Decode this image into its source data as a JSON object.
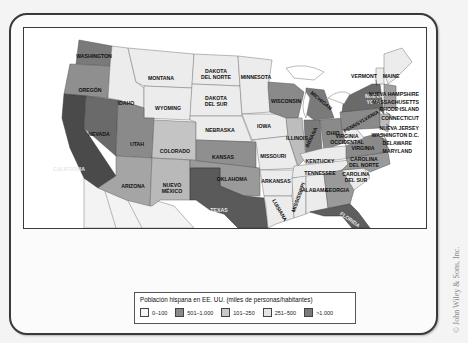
{
  "map": {
    "title": "Población hispana en EE. UU. (miles de personas/habitantes)",
    "colors": {
      "c0_100": "#ececec",
      "c101_250": "#c9c9c9",
      "c251_500": "#a9a9a9",
      "c501_1000": "#8a8a8a",
      "c1000_plus": "#555555",
      "water": "#ffffff",
      "mexico": "#f2f2f2"
    },
    "states": {
      "washington": "WASHINGTON",
      "oregon": "OREGÓN",
      "california": "CALIFORNIA",
      "nevada": "NEVADA",
      "idaho": "IDAHO",
      "montana": "MONTANA",
      "wyoming": "WYOMING",
      "utah": "UTAH",
      "colorado": "COLORADO",
      "arizona": "ARIZONA",
      "nuevo_mexico_1": "NUEVO",
      "nuevo_mexico_2": "MÉXICO",
      "dakota_norte_1": "DAKOTA",
      "dakota_norte_2": "DEL NORTE",
      "dakota_sur_1": "DAKOTA",
      "dakota_sur_2": "DEL SUR",
      "nebraska": "NEBRASKA",
      "kansas": "KANSAS",
      "oklahoma": "OKLAHOMA",
      "texas": "TEXAS",
      "minnesota": "MINNESOTA",
      "iowa": "IOWA",
      "missouri": "MISSOURI",
      "arkansas": "ARKANSAS",
      "luisiana": "LUISIANA",
      "wisconsin": "WISCONSIN",
      "illinois": "ILLINOIS",
      "michigan": "MICHIGAN",
      "indiana": "INDIANA",
      "ohio": "OHIO",
      "kentucky": "KENTUCKY",
      "tennessee": "TENNESSEE",
      "mississippi": "MISSISSIPPI",
      "alabama": "ALABAMA",
      "georgia": "GEORGIA",
      "florida": "FLORIDA",
      "carolina_sur_1": "CAROLINA",
      "carolina_sur_2": "DEL SUR",
      "carolina_norte_1": "CAROLINA",
      "carolina_norte_2": "DEL NORTE",
      "virginia": "VIRGINIA",
      "virginia_occ_1": "VIRGINIA",
      "virginia_occ_2": "OCCIDENTAL",
      "pennsylvania": "PENNSYLVANIA",
      "nueva_york_1": "NUEVA",
      "nueva_york_2": "YORK",
      "vermont": "VERMONT",
      "maine": "MAINE",
      "nueva_hampshire": "NUEVA HAMPSHIRE",
      "massachusetts": "MASSACHUSETTS",
      "rhode_island": "RHODE ISLAND",
      "connecticut": "CONNECTICUT",
      "nueva_jersey": "NUEVA JERSEY",
      "washington_dc": "WASHINGTON D.C.",
      "delaware": "DELAWARE",
      "maryland": "MARYLAND"
    }
  },
  "legend": {
    "title": "Población hispana en EE. UU. (miles de personas/habitantes)",
    "items": [
      {
        "label": "0–100",
        "color": "#f5f5f5"
      },
      {
        "label": "501–1.000",
        "color": "#8a8a8a"
      },
      {
        "label": "101–250",
        "color": "#c9c9c9"
      },
      {
        "label": "251–500",
        "color": "#e4e4e4"
      },
      {
        "label": ">1.000",
        "color": "#7a7a7a"
      }
    ]
  },
  "copyright": "© John Wiley & Sons, Inc."
}
